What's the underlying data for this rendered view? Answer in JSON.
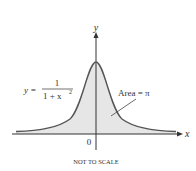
{
  "figure": {
    "axes": {
      "x_label": "x",
      "y_label": "y",
      "origin_label": "0"
    },
    "equation": {
      "lhs": "y =",
      "numerator": "1",
      "denominator": "1 + x",
      "exponent": "2"
    },
    "annotation": {
      "label": "Area = π"
    },
    "caption": "NOT TO SCALE",
    "colors": {
      "curve": "#555555",
      "fill": "#e6e6e6",
      "axis": "#333333"
    }
  }
}
